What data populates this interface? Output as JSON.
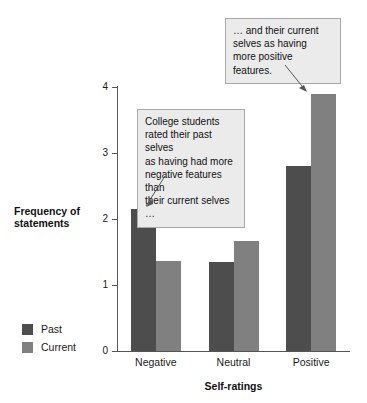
{
  "chart_data": {
    "type": "bar",
    "title": "",
    "subtitle": "",
    "xlabel": "Self-ratings",
    "ylabel": "Frequency of statements",
    "categories": [
      "Negative",
      "Neutral",
      "Positive"
    ],
    "series": [
      {
        "name": "Past",
        "color": "#4d4d4d",
        "values": [
          2.15,
          1.35,
          2.8
        ]
      },
      {
        "name": "Current",
        "color": "#808080",
        "values": [
          1.36,
          1.67,
          3.89
        ]
      }
    ],
    "ylim": [
      0,
      4
    ],
    "yticks": [
      0,
      1,
      2,
      3,
      4
    ],
    "ytick_labels": [
      "0",
      "1",
      "2",
      "3",
      "4"
    ],
    "grid": false,
    "legend_position": "lower-left-outside",
    "annotations": [
      {
        "id": "callout-past",
        "text": "College students rated their past selves as having had more negative features than their current selves …",
        "lines": [
          "College students",
          "rated their past selves",
          "as having had more",
          "negative features than",
          "their current selves …"
        ],
        "points_to": {
          "category": "Negative",
          "series": "Past"
        }
      },
      {
        "id": "callout-current",
        "text": "… and their current selves as having more positive features.",
        "lines": [
          "… and their current",
          "selves as having",
          "more positive features."
        ],
        "points_to": {
          "category": "Positive",
          "series": "Current"
        }
      }
    ]
  },
  "figure": {
    "background_color": "#ffffff",
    "axis_color": "#555555",
    "callout_fill": "#ebebeb",
    "callout_border": "#a8a8a8"
  }
}
